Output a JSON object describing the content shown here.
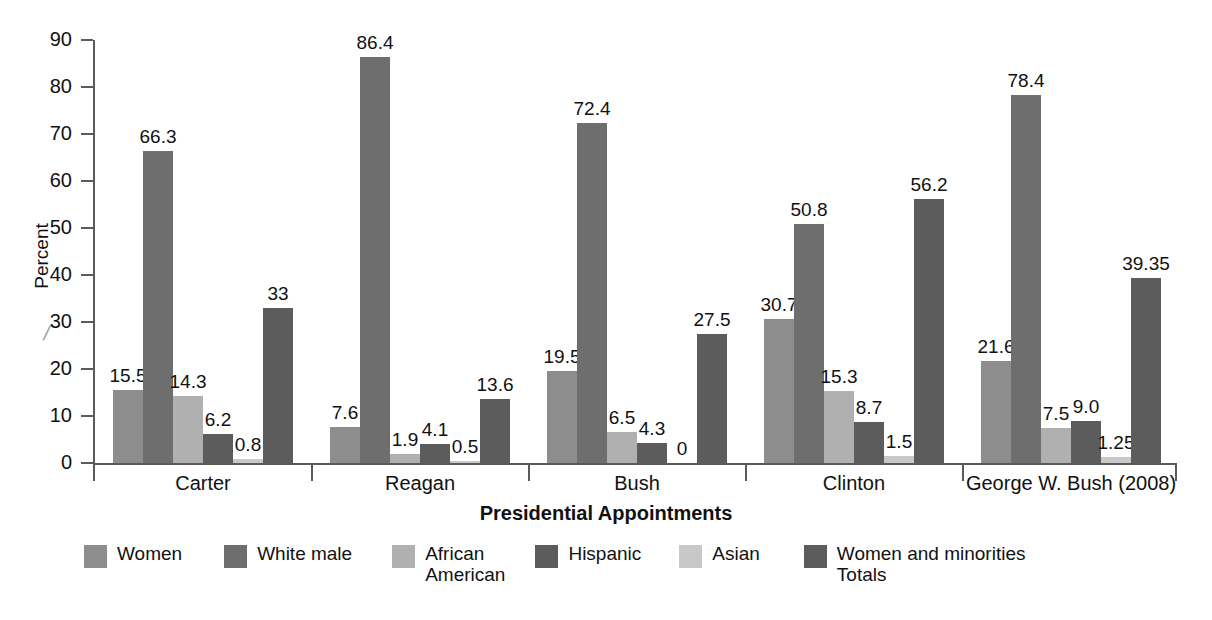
{
  "chart_data": {
    "type": "bar",
    "title": "",
    "xlabel": "Presidential Appointments",
    "ylabel": "Percent",
    "ylim": [
      0,
      90
    ],
    "yticks": [
      0,
      10,
      20,
      30,
      40,
      50,
      60,
      70,
      80,
      90
    ],
    "grid": false,
    "legend_position": "bottom",
    "axis_break": true,
    "categories": [
      "Carter",
      "Reagan",
      "Bush",
      "Clinton",
      "George W. Bush (2008)"
    ],
    "series": [
      {
        "name": "Women",
        "color": "#8d8d8d",
        "values": [
          15.5,
          7.6,
          19.5,
          30.7,
          21.6
        ],
        "labels": [
          "15.5",
          "7.6",
          "19.5",
          "30.7",
          "21.6"
        ]
      },
      {
        "name": "White male",
        "color": "#6e6e6e",
        "values": [
          66.3,
          86.4,
          72.4,
          50.8,
          78.4
        ],
        "labels": [
          "66.3",
          "86.4",
          "72.4",
          "50.8",
          "78.4"
        ]
      },
      {
        "name": "African\nAmerican",
        "color": "#b0b0b0",
        "values": [
          14.3,
          1.9,
          6.5,
          15.3,
          7.5
        ],
        "labels": [
          "14.3",
          "1.9",
          "6.5",
          "15.3",
          "7.5"
        ]
      },
      {
        "name": "Hispanic",
        "color": "#5c5c5c",
        "values": [
          6.2,
          4.1,
          4.3,
          8.7,
          9.0
        ],
        "labels": [
          "6.2",
          "4.1",
          "4.3",
          "8.7",
          "9.0"
        ]
      },
      {
        "name": "Asian",
        "color": "#c8c8c8",
        "values": [
          0.8,
          0.5,
          0,
          1.5,
          1.25
        ],
        "labels": [
          "0.8",
          "0.5",
          "0",
          "1.5",
          "1.25"
        ]
      },
      {
        "name": "Women and minorities\nTotals",
        "color": "#5c5c5c",
        "values": [
          33,
          13.6,
          27.5,
          56.2,
          39.35
        ],
        "labels": [
          "33",
          "13.6",
          "27.5",
          "56.2",
          "39.35"
        ]
      }
    ]
  },
  "legend": {
    "items": [
      {
        "label": "Women",
        "color": "#8d8d8d"
      },
      {
        "label": "White male",
        "color": "#6e6e6e"
      },
      {
        "label": "African\nAmerican",
        "color": "#b0b0b0"
      },
      {
        "label": "Hispanic",
        "color": "#5c5c5c"
      },
      {
        "label": "Asian",
        "color": "#c8c8c8"
      },
      {
        "label": "Women and minorities\nTotals",
        "color": "#5c5c5c"
      }
    ]
  }
}
